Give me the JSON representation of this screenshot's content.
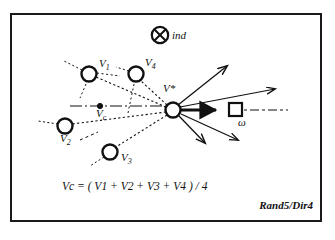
{
  "figure": {
    "caption": "Rand5/Dir4",
    "formula": "Vᴄ = ( V1 + V2 + V3 + V4 ) / 4",
    "formula_parts": {
      "lhs_base": "V",
      "lhs_sub": "c",
      "equals": "= (",
      "terms": [
        "V1",
        "V2",
        "V3",
        "V4"
      ],
      "plus": "+",
      "close": ") / 4"
    },
    "frame": {
      "color": "#1a1a1a",
      "width_px": 312,
      "height_px": 209
    },
    "background": "#ffffff",
    "ink": "#111111"
  },
  "legend": {
    "ind_symbol": "⊗",
    "ind_label": "ind"
  },
  "nodes": [
    {
      "id": "v1",
      "label_base": "V",
      "label_sub": "1",
      "label": "V1",
      "cx": 89,
      "cy": 74,
      "r": 7.5,
      "label_x": 99,
      "label_y": 63
    },
    {
      "id": "v4",
      "label_base": "V",
      "label_sub": "4",
      "label": "V4",
      "cx": 136,
      "cy": 74,
      "r": 7.5,
      "label_x": 145,
      "label_y": 62
    },
    {
      "id": "v2",
      "label_base": "V",
      "label_sub": "2",
      "label": "V2",
      "cx": 65,
      "cy": 126,
      "r": 7.5,
      "label_x": 64,
      "label_y": 140
    },
    {
      "id": "v3",
      "label_base": "V",
      "label_sub": "3",
      "label": "V3",
      "cx": 110,
      "cy": 152,
      "r": 7.5,
      "label_x": 122,
      "label_y": 157
    }
  ],
  "hub": {
    "id": "vstar",
    "label": "V*",
    "cx": 173,
    "cy": 110,
    "r": 7.5,
    "label_x": 164,
    "label_y": 88
  },
  "centroid": {
    "id": "vc",
    "label_base": "V",
    "label_sub": "c",
    "label": "Vc",
    "cx": 100,
    "cy": 106,
    "r": 2.6,
    "label_x": 101,
    "label_y": 113
  },
  "goal": {
    "id": "omega-square",
    "label": "ω",
    "x": 229,
    "y": 103,
    "size": 13,
    "label_x": 240,
    "label_y": 122
  },
  "direction_arrows": [
    {
      "id": "dir-up-steep",
      "x2": 229,
      "y2": 64,
      "bold": false
    },
    {
      "id": "dir-up-shallow",
      "x2": 277,
      "y2": 88,
      "bold": false
    },
    {
      "id": "dir-forward",
      "x2": 219,
      "y2": 110,
      "bold": true
    },
    {
      "id": "dir-down-steep",
      "x2": 207,
      "y2": 146,
      "bold": false
    },
    {
      "id": "dir-down-shallow",
      "x2": 240,
      "y2": 142,
      "bold": false
    }
  ]
}
